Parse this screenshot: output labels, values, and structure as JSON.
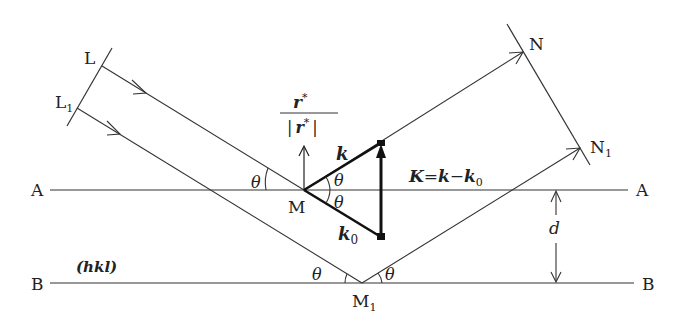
{
  "diagram": {
    "type": "Bragg reflection geometry",
    "planes": {
      "upper": {
        "left_label": "A",
        "right_label": "A"
      },
      "lower": {
        "left_label": "B",
        "right_label": "B"
      },
      "miller_label": "(hkl)",
      "spacing_label": "d"
    },
    "wavefronts": {
      "incident": {
        "top_label": "L",
        "bottom_label": "L",
        "bottom_sub": "1"
      },
      "reflected": {
        "top_label": "N",
        "bottom_label": "N",
        "bottom_sub": "1"
      }
    },
    "points": {
      "upper_reflection": "M",
      "lower_reflection": "M",
      "lower_reflection_sub": "1"
    },
    "angles": {
      "theta": "θ"
    },
    "vectors": {
      "k": "k",
      "k0": "k",
      "k0_sub": "0",
      "normal_num": "r",
      "normal_num_sup": "*",
      "normal_den_bar": "|",
      "normal_den": "r",
      "normal_den_sup": "*",
      "scattering_eq_K": "K",
      "scattering_eq_eq": "=",
      "scattering_eq_k": "k",
      "scattering_eq_minus": "−",
      "scattering_eq_k0": "k",
      "scattering_eq_k0_sub": "0"
    }
  }
}
